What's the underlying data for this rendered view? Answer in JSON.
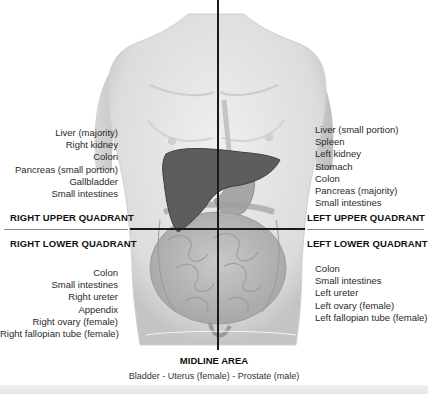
{
  "diagram": {
    "type": "abdominal-quadrants-anatomy",
    "colors": {
      "skin": "#e6e6e6",
      "skin_shadow": "#c9c9c9",
      "liver": "#5a5a5a",
      "intestine": "#bdbdbd",
      "axis_line": "#1a1a1a",
      "divider": "#8a8a8a"
    }
  },
  "quadrants": {
    "right_upper": {
      "title": "RIGHT UPPER QUADRANT",
      "organs": [
        "Liver (majority)",
        "Right kidney",
        "Colon",
        "Pancreas (small portion)",
        "Gallbladder",
        "Small intestines"
      ]
    },
    "left_upper": {
      "title": "LEFT UPPER QUADRANT",
      "organs": [
        "Liver (small portion)",
        "Spleen",
        "Left kidney",
        "Stomach",
        "Colon",
        "Pancreas (majority)",
        "Small intestines"
      ]
    },
    "right_lower": {
      "title": "RIGHT LOWER QUADRANT",
      "organs": [
        "Colon",
        "Small intestines",
        "Right ureter",
        "Appendix",
        "Right ovary (female)",
        "Right fallopian tube (female)"
      ]
    },
    "left_lower": {
      "title": "LEFT LOWER QUADRANT",
      "organs": [
        "Colon",
        "Small intestines",
        "Left ureter",
        "Left ovary (female)",
        "Left fallopian tube (female)"
      ]
    }
  },
  "midline": {
    "title": "MIDLINE AREA",
    "text": "Bladder - Uterus (female) - Prostate (male)"
  }
}
